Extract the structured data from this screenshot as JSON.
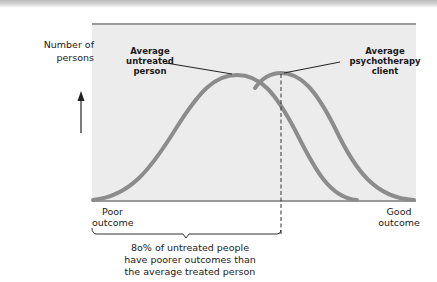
{
  "diagram": {
    "y_axis_label": "Number of persons",
    "y_axis_label_lines": [
      "Number of",
      "persons"
    ],
    "x_axis_left_label": "Poor outcome",
    "x_axis_left_lines": [
      "Poor",
      "outcome"
    ],
    "x_axis_right_label": "Good outcome",
    "x_axis_right_lines": [
      "Good",
      "outcome"
    ],
    "curves": [
      {
        "name": "Average untreated person",
        "lines": [
          "Average",
          "untreated",
          "person"
        ],
        "peak_position": "left"
      },
      {
        "name": "Average psychotherapy client",
        "lines": [
          "Average",
          "psychotherapy",
          "client"
        ],
        "peak_position": "right"
      }
    ],
    "caption": "80% of untreated people have poorer outcomes than the average treated person",
    "caption_lines": [
      "8o% of untreated people",
      "have poorer outcomes than",
      "the average treated person"
    ],
    "colors": {
      "curve": "#8c8c8c",
      "plot_background": "#ececec",
      "axis_line": "#9a9a9a",
      "text": "#1a1a1a"
    }
  }
}
